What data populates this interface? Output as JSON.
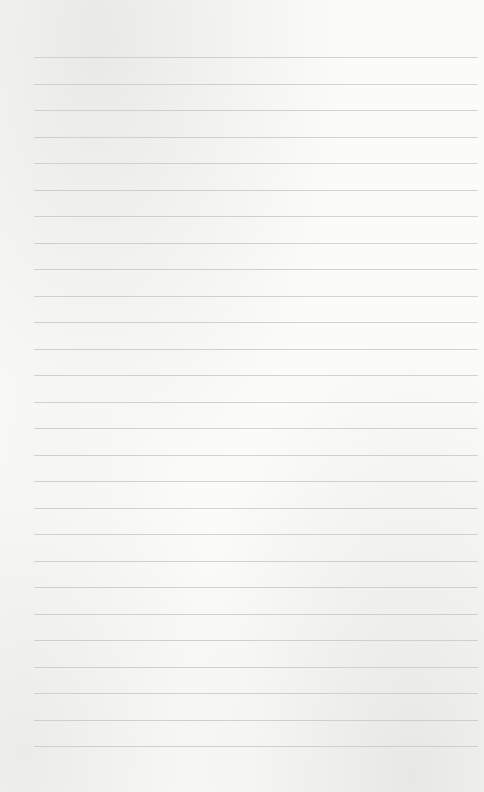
{
  "document": {
    "type": "blank lined notebook page",
    "text": "",
    "lines": {
      "count": 27,
      "first_y": 57,
      "spacing": 26.5,
      "left_x": 34,
      "width": 444,
      "color": "#c9c9c9"
    },
    "paper_color": "#fbfbfa"
  }
}
